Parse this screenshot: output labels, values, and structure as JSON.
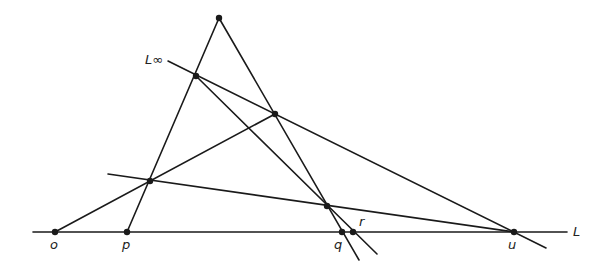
{
  "diagram": {
    "stroke_color": "#1a1a1a",
    "labels": {
      "L_inf": "L∞",
      "L": "L",
      "o": "o",
      "p": "p",
      "q": "q",
      "r": "r",
      "u": "u"
    },
    "points": {
      "apex": [
        219,
        18
      ],
      "a": [
        196,
        76
      ],
      "b": [
        275,
        114
      ],
      "c": [
        150,
        181
      ],
      "d": [
        327,
        206
      ],
      "o": [
        55,
        232
      ],
      "p": [
        127,
        232
      ],
      "q": [
        342,
        232
      ],
      "r": [
        353,
        232
      ],
      "u": [
        514,
        232
      ]
    }
  }
}
